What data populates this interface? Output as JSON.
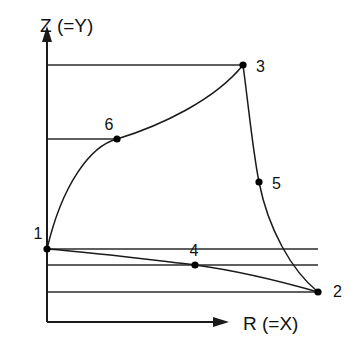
{
  "figure": {
    "background_color": "#ffffff",
    "line_color": "#1a1a1a",
    "node_color": "#000000"
  },
  "axes": {
    "vertical": {
      "label": "Z (=Y)",
      "name": "z-axis",
      "label_x": 40,
      "label_y": 30,
      "x": 47,
      "y_top": 28,
      "y_bottom": 322,
      "arrow_tip_y": 28
    },
    "horizontal": {
      "label": "R (=X)",
      "name": "r-axis",
      "label_x": 243,
      "label_y": 327,
      "y": 322,
      "x_left": 47,
      "x_right": 227,
      "arrow_tip_x": 227
    }
  },
  "nodes": [
    {
      "id": "1",
      "label": "1",
      "x": 47,
      "y": 249,
      "label_x": 38,
      "label_y": 239,
      "anchor": "middle"
    },
    {
      "id": "2",
      "label": "2",
      "x": 318,
      "y": 292,
      "label_x": 333,
      "label_y": 297,
      "anchor": "start"
    },
    {
      "id": "3",
      "label": "3",
      "x": 243,
      "y": 65,
      "label_x": 256,
      "label_y": 72,
      "anchor": "start"
    },
    {
      "id": "4",
      "label": "4",
      "x": 195,
      "y": 265,
      "label_x": 194,
      "label_y": 256,
      "anchor": "middle"
    },
    {
      "id": "5",
      "label": "5",
      "x": 259,
      "y": 182,
      "label_x": 272,
      "label_y": 189,
      "anchor": "start"
    },
    {
      "id": "6",
      "label": "6",
      "x": 117,
      "y": 139,
      "label_x": 109,
      "label_y": 130,
      "anchor": "middle"
    }
  ],
  "gridlines": [
    {
      "name": "gridline-to-node-3",
      "x1": 47,
      "y1": 65,
      "x2": 243,
      "y2": 65
    },
    {
      "name": "gridline-to-node-6",
      "x1": 47,
      "y1": 139,
      "x2": 117,
      "y2": 139
    },
    {
      "name": "gridline-to-node-1",
      "x1": 47,
      "y1": 249,
      "x2": 318,
      "y2": 249
    },
    {
      "name": "gridline-to-node-4",
      "x1": 47,
      "y1": 265,
      "x2": 318,
      "y2": 265
    },
    {
      "name": "gridline-to-node-2",
      "x1": 47,
      "y1": 292,
      "x2": 318,
      "y2": 292
    }
  ],
  "curves": [
    {
      "name": "curve-1-6-3",
      "from": "1",
      "through": "6",
      "to": "3",
      "path": "M 47 249 C 62 185, 90 146, 117 139 C 160 126, 215 100, 243 65"
    },
    {
      "name": "curve-3-5-2",
      "from": "3",
      "through": "5",
      "to": "2",
      "path": "M 243 65 C 249 110, 253 152, 259 182 C 268 228, 291 270, 318 292"
    },
    {
      "name": "curve-1-4-2",
      "from": "1",
      "through": "4",
      "to": "2",
      "path": "M 47 249 C 100 253, 160 261, 195 265 C 240 271, 290 284, 318 292"
    }
  ]
}
